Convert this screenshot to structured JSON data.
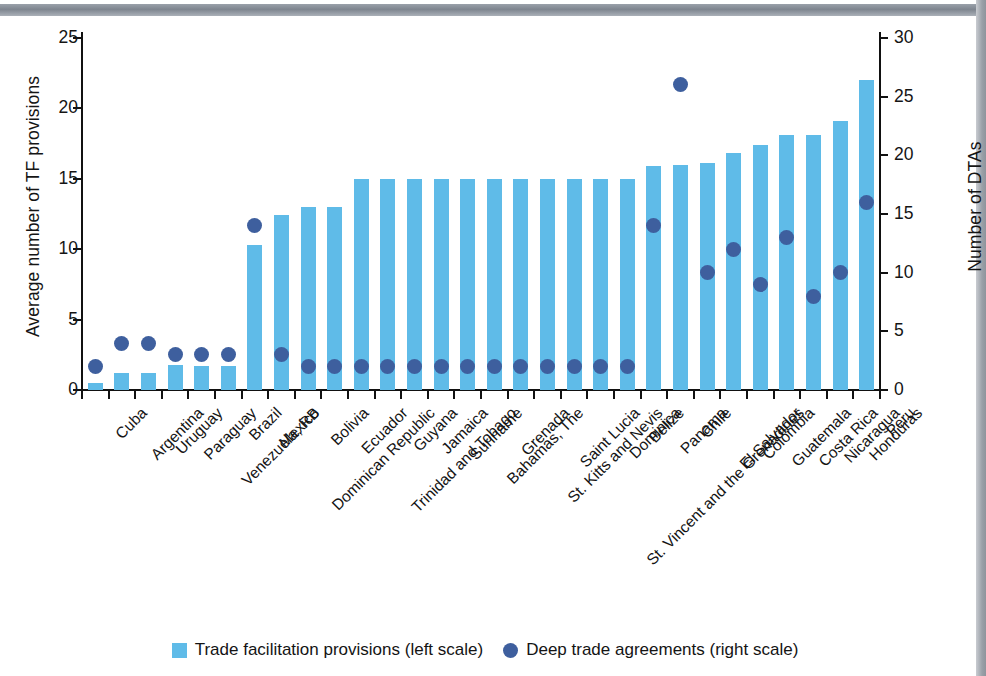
{
  "chart_data": {
    "type": "bar",
    "title": "",
    "subtitle": "",
    "xlabel": "",
    "ylabel": "Average number of TF provisions",
    "y2label": "Number of DTAs",
    "ylim": [
      0,
      25
    ],
    "y2lim": [
      0,
      30
    ],
    "yticks": [
      "0",
      "5",
      "10",
      "15",
      "20",
      "25"
    ],
    "y2ticks": [
      "0",
      "5",
      "10",
      "15",
      "20",
      "25",
      "30"
    ],
    "grid": false,
    "legend_position": "bottom-center",
    "categories": [
      "Cuba",
      "Argentina",
      "Uruguay",
      "Paraguay",
      "Venezuela, RB",
      "Brazil",
      "Mexico",
      "Dominican Republic",
      "Bolivia",
      "Ecuador",
      "Trinidad and Tobago",
      "Guyana",
      "Jamaica",
      "Suriname",
      "Bahamas, The",
      "Grenada",
      "St. Kitts and Nevis",
      "Saint Lucia",
      "St. Vincent and the Grenadines",
      "Dominica",
      "Belize",
      "Panama",
      "Chile",
      "El Salvador",
      "Colombia",
      "Guatemala",
      "Costa Rica",
      "Nicaragua",
      "Honduras",
      "Peru"
    ],
    "series": [
      {
        "name": "Trade facilitation provisions (left scale)",
        "axis": "left",
        "mark": "bar",
        "color": "#5fbbe8",
        "values": [
          0.5,
          1.2,
          1.2,
          1.8,
          1.7,
          1.7,
          10.3,
          12.4,
          13.0,
          13.0,
          15.0,
          15.0,
          15.0,
          15.0,
          15.0,
          15.0,
          15.0,
          15.0,
          15.0,
          15.0,
          15.0,
          15.9,
          16.0,
          16.1,
          16.8,
          17.4,
          18.1,
          18.1,
          19.1,
          22.0
        ]
      },
      {
        "name": "Deep trade agreements (right scale)",
        "axis": "right",
        "mark": "circle",
        "color": "#3e5f9e",
        "values": [
          2.0,
          4.0,
          4.0,
          3.0,
          3.0,
          3.0,
          14.0,
          3.0,
          2.0,
          2.0,
          2.0,
          2.0,
          2.0,
          2.0,
          2.0,
          2.0,
          2.0,
          2.0,
          2.0,
          2.0,
          2.0,
          14.0,
          26.0,
          10.0,
          12.0,
          9.0,
          13.0,
          8.0,
          10.0,
          16.0
        ]
      }
    ]
  },
  "legend": {
    "items": [
      {
        "label": "Trade facilitation provisions (left scale)",
        "swatch": "square",
        "color": "#5fbbe8"
      },
      {
        "label": "Deep trade agreements (right scale)",
        "swatch": "circle",
        "color": "#3e5f9e"
      }
    ]
  }
}
